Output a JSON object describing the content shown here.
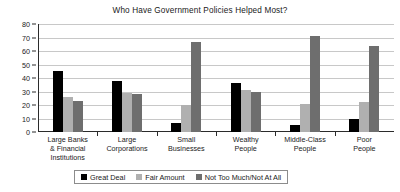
{
  "chart_data": {
    "type": "bar",
    "title": "Who Have Government Policies Helped Most?",
    "xlabel": "",
    "ylabel": "Percent of Respondents",
    "ylim": [
      0,
      80
    ],
    "ytick_step": 10,
    "yticks": [
      0,
      10,
      20,
      30,
      40,
      50,
      60,
      70,
      80
    ],
    "grid": true,
    "legend_position": "bottom",
    "categories": [
      "Large Banks\n& Financial\nInstitutions",
      "Large\nCorporations",
      "Small\nBusinesses",
      "Wealthy\nPeople",
      "Middle-Class\nPeople",
      "Poor\nPeople"
    ],
    "category_lines": [
      [
        "Large Banks",
        "& Financial",
        "Institutions"
      ],
      [
        "Large",
        "Corporations"
      ],
      [
        "Small",
        "Businesses"
      ],
      [
        "Wealthy",
        "People"
      ],
      [
        "Middle-Class",
        "People"
      ],
      [
        "Poor",
        "People"
      ]
    ],
    "series": [
      {
        "name": "Great Deal",
        "color": "#000000",
        "values": [
          45,
          38,
          7,
          36,
          5,
          10
        ]
      },
      {
        "name": "Fair Amount",
        "color": "#b0b0b0",
        "values": [
          26,
          29,
          20,
          31,
          21,
          22
        ]
      },
      {
        "name": "Not Too Much/Not At All",
        "color": "#6e6e6e",
        "values": [
          23,
          28,
          67,
          30,
          71,
          64
        ]
      }
    ]
  },
  "colors": {
    "great_deal": "#000000",
    "fair_amount": "#b0b0b0",
    "not_too_much": "#6e6e6e",
    "gridline": "#c8c8c8",
    "axis": "#2b2b2b",
    "background": "#ffffff"
  }
}
